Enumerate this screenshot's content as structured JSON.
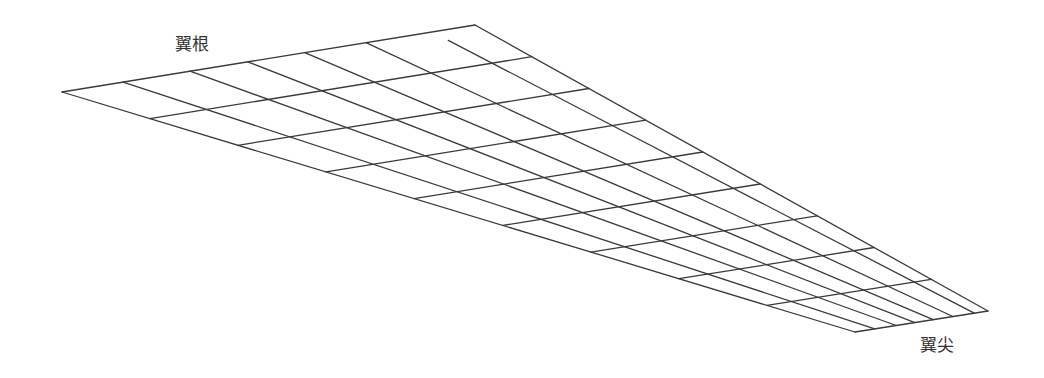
{
  "labels": {
    "root": "翼根",
    "tip": "翼尖"
  },
  "label_positions": {
    "root": {
      "x": 175,
      "y": 36
    },
    "tip": {
      "x": 920,
      "y": 337
    }
  },
  "mesh": {
    "line_color": "#3a3a3a",
    "line_width": 1.3,
    "corners": {
      "root_leading": [
        62,
        92
      ],
      "root_trailing": [
        475,
        25
      ],
      "tip_trailing": [
        988,
        311
      ],
      "tip_leading": [
        855,
        332
      ]
    },
    "chord_fractions": [
      0,
      0.148,
      0.31,
      0.45,
      0.588,
      0.736,
      0.896,
      1
    ],
    "span_fractions": [
      0,
      0.111,
      0.222,
      0.333,
      0.444,
      0.556,
      0.667,
      0.778,
      0.889,
      1
    ],
    "spanwise_line_start_offsets": [
      0,
      0,
      0,
      0,
      0,
      0,
      0.03,
      0
    ]
  }
}
